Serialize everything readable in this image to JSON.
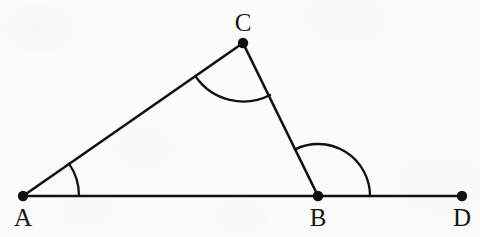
{
  "figure": {
    "kind": "geometry-diagram",
    "stroke_color": "#111111",
    "background_color": "#fbfbfa",
    "line_width": 2.6,
    "dot_radius": 5.2,
    "canvas": {
      "width": 480,
      "height": 237
    },
    "points": [
      {
        "id": "A",
        "label": "A",
        "x": 23,
        "y": 196,
        "label_x": 23,
        "label_y": 217,
        "dot": true
      },
      {
        "id": "B",
        "label": "B",
        "x": 318,
        "y": 196,
        "label_x": 318,
        "label_y": 217,
        "dot": true
      },
      {
        "id": "C",
        "label": "C",
        "x": 243,
        "y": 43,
        "label_x": 243,
        "label_y": 22,
        "dot": true
      },
      {
        "id": "D",
        "label": "D",
        "x": 462,
        "y": 196,
        "label_x": 462,
        "label_y": 217,
        "dot": true
      }
    ],
    "segments": [
      {
        "id": "AD",
        "from": "A",
        "to": "D",
        "x1": 23,
        "y1": 196,
        "x2": 462,
        "y2": 196
      },
      {
        "id": "AC",
        "from": "A",
        "to": "C",
        "x1": 23,
        "y1": 196,
        "x2": 243,
        "y2": 43
      },
      {
        "id": "CB",
        "from": "C",
        "to": "B",
        "x1": 243,
        "y1": 43,
        "x2": 318,
        "y2": 196
      }
    ],
    "angle_arcs": [
      {
        "id": "angle-A",
        "vertex": "A",
        "radius": 56,
        "start_deg": 0,
        "end_deg": 34.8,
        "path": "M 79 196 A 56 56 0 0 0 68.96 163.68"
      },
      {
        "id": "angle-C",
        "vertex": "C",
        "radius": 58,
        "start_deg": -144.2,
        "end_deg": -26.1,
        "path": "M 196.0 77.0 A 58 58 0 0 0 270.1 95.0"
      },
      {
        "id": "angle-B",
        "vertex": "B",
        "radius": 52,
        "start_deg": 0,
        "end_deg": 116.1,
        "path": "M 370 196 A 52 52 0 0 0 294.9 149.4"
      }
    ]
  }
}
